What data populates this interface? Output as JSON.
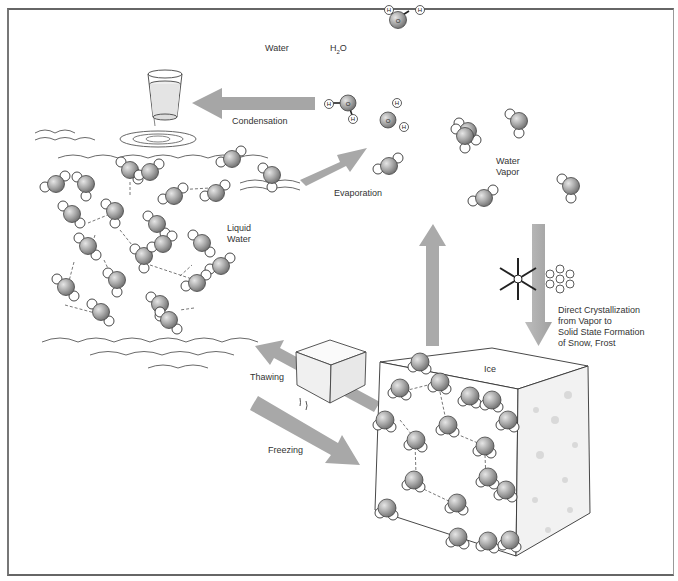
{
  "diagram": {
    "type": "water phase change cycle",
    "header": {
      "water_label": "Water",
      "formula_label": "H2O",
      "formula_parts": {
        "h": "H",
        "sub": "2",
        "o": "O"
      },
      "molecule_atoms": {
        "oxygen": "O",
        "hydrogen": "H"
      }
    },
    "regions": {
      "liquid": "Liquid\nWater",
      "liquid_lines": [
        "Liquid",
        "Water"
      ],
      "vapor_lines": [
        "Water",
        "Vapor"
      ],
      "ice": "Ice"
    },
    "processes": {
      "condensation": "Condensation",
      "evaporation": "Evaporation",
      "thawing": "Thawing",
      "freezing": "Freezing",
      "direct_crystallization_lines": [
        "Direct Crystallization",
        "from Vapor to",
        "Solid State Formation",
        "of Snow, Frost"
      ]
    },
    "arrows": [
      {
        "name": "condensation-arrow",
        "from": "water vapor",
        "to": "liquid water",
        "direction": "left"
      },
      {
        "name": "evaporation-arrow",
        "from": "liquid water",
        "to": "water vapor",
        "direction": "up-right"
      },
      {
        "name": "sublimation-up-arrow",
        "from": "ice",
        "to": "water vapor",
        "direction": "up"
      },
      {
        "name": "deposition-down-arrow",
        "from": "water vapor",
        "to": "ice",
        "direction": "down"
      },
      {
        "name": "thawing-arrow",
        "from": "ice",
        "to": "liquid water",
        "direction": "up-left"
      },
      {
        "name": "freezing-arrow",
        "from": "liquid water",
        "to": "ice",
        "direction": "down-right"
      }
    ],
    "colors": {
      "arrow": "#a8a8a8",
      "molecule_oxygen": "#9a9a9a",
      "outline": "#333333",
      "frame": "#666666"
    }
  }
}
